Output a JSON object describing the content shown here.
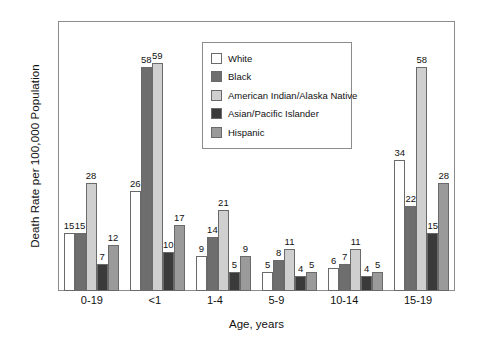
{
  "chart_data": {
    "type": "bar",
    "title": "",
    "xlabel": "Age, years",
    "ylabel": "Death Rate per 100,000 Population",
    "ylim": [
      0,
      70
    ],
    "yticks": [
      0,
      10,
      20,
      30,
      40,
      50,
      60,
      70
    ],
    "grid": false,
    "legend_position": "upper-center-inside",
    "categories": [
      "0-19",
      "<1",
      "1-4",
      "5-9",
      "10-14",
      "15-19"
    ],
    "series": [
      {
        "name": "White",
        "color": "#ffffff",
        "values": [
          15,
          26,
          9,
          5,
          6,
          34
        ]
      },
      {
        "name": "Black",
        "color": "#6e6e6e",
        "values": [
          15,
          58,
          14,
          8,
          7,
          22
        ]
      },
      {
        "name": "American Indian/Alaska Native",
        "color": "#cfcfcf",
        "values": [
          28,
          59,
          21,
          11,
          11,
          58
        ]
      },
      {
        "name": "Asian/Pacific Islander",
        "color": "#3a3a3a",
        "values": [
          7,
          10,
          5,
          4,
          4,
          15
        ]
      },
      {
        "name": "Hispanic",
        "color": "#9a9a9a",
        "values": [
          12,
          17,
          9,
          5,
          5,
          28
        ]
      }
    ]
  },
  "colors": {
    "axis": "#8c8c8c",
    "bar_outline": "#6a6a6a",
    "text": "#111111",
    "background": "#ffffff"
  }
}
